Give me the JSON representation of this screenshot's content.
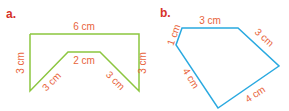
{
  "figures": [
    {
      "label": "a.",
      "color": "#8cc63f",
      "sides": {
        "top": "6 cm",
        "left": "3 cm",
        "right": "3 cm",
        "inner_top": "2 cm",
        "inner_left": "3 cm",
        "inner_right": "3 cm"
      }
    },
    {
      "label": "b.",
      "color": "#29a9e0",
      "sides": {
        "top": "3 cm",
        "top_left": "1 cm",
        "top_right": "3 cm",
        "bottom_left": "4 cm",
        "bottom_right": "4 cm"
      }
    }
  ],
  "colors": {
    "label_text": "#e8643c",
    "heading": "#d6322a"
  }
}
